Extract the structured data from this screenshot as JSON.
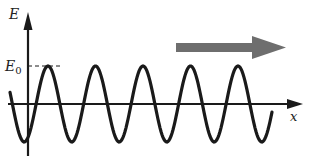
{
  "figure": {
    "type": "sinusoidal-wave-diagram",
    "labels": {
      "y_axis": "E",
      "amplitude": "E",
      "amplitude_sub": "0",
      "x_axis": "x"
    },
    "wave": {
      "amplitude_px": 38,
      "period_px": 47.5,
      "baseline_y": 104,
      "start_x": 10,
      "end_x": 272,
      "phase_peak_x": 48,
      "stroke": "#1a1a1a"
    },
    "propagation_arrow": {
      "direction": "right",
      "color": "#6e6e6e"
    },
    "colors": {
      "axis": "#1a1a1a",
      "background": "#ffffff"
    }
  }
}
